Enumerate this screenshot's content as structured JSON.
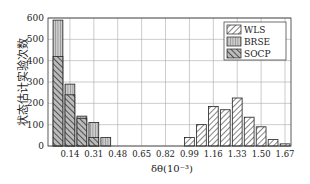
{
  "chart_data": {
    "type": "bar",
    "title": "",
    "xlabel": "δθ(10⁻³)",
    "ylabel": "状态估计实验次数",
    "ylim": [
      0,
      600
    ],
    "yticks": [
      0,
      100,
      200,
      300,
      400,
      500,
      600
    ],
    "xtick_labels": [
      "0.14",
      "0.31",
      "0.48",
      "0.65",
      "0.82",
      "0.99",
      "1.16",
      "1.33",
      "1.50",
      "1.67"
    ],
    "grid": true,
    "legend_position": "upper right",
    "bins": [
      0.06,
      0.14,
      0.23,
      0.31,
      0.4,
      0.48,
      0.57,
      0.65,
      0.74,
      0.82,
      0.91,
      0.99,
      1.08,
      1.16,
      1.25,
      1.33,
      1.42,
      1.5,
      1.59,
      1.67
    ],
    "series": [
      {
        "name": "WLS",
        "values": [
          0,
          0,
          0,
          0,
          0,
          0,
          0,
          0,
          0,
          0,
          0,
          40,
          100,
          185,
          170,
          225,
          135,
          90,
          30,
          10
        ]
      },
      {
        "name": "BRSE",
        "values": [
          590,
          290,
          140,
          110,
          40,
          0,
          0,
          0,
          0,
          0,
          0,
          0,
          0,
          0,
          0,
          0,
          0,
          0,
          0,
          0
        ]
      },
      {
        "name": "SOCP",
        "values": [
          420,
          240,
          130,
          40,
          0,
          0,
          0,
          0,
          0,
          0,
          0,
          0,
          0,
          0,
          0,
          0,
          0,
          0,
          0,
          0
        ]
      }
    ]
  }
}
